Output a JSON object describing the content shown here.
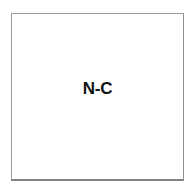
{
  "diagram": {
    "type": "single-node-box",
    "background_color": "#ffffff",
    "node": {
      "label": "N-C",
      "label_color": "#111111",
      "fill_color": "#ffffff",
      "border_color": "#9d9d9d",
      "shape": "rectangle"
    }
  }
}
